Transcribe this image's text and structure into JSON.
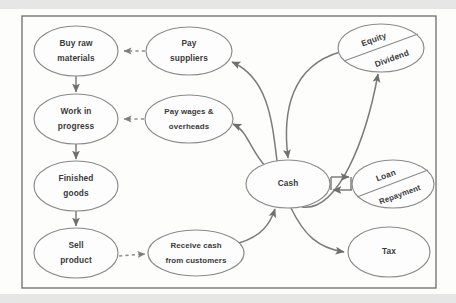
{
  "diagram": {
    "type": "flow-diagram",
    "frame": {
      "x": 22,
      "y": 16,
      "width": 414,
      "height": 272
    },
    "palette": {
      "page_background": "#fdfdfc",
      "node_fill": "#fdfdfd",
      "node_stroke": "#8a8a8a",
      "edge_stroke": "#7c7c7c",
      "frame_stroke": "#6d6d6d",
      "text": "#3a3a3a"
    },
    "nodes": [
      {
        "id": "buy-raw-materials",
        "lines": [
          "Buy raw",
          "materials"
        ],
        "cx": 76,
        "cy": 51,
        "rx": 42,
        "ry": 25,
        "split": false
      },
      {
        "id": "work-in-progress",
        "lines": [
          "Work in",
          "progress"
        ],
        "cx": 76,
        "cy": 119,
        "rx": 42,
        "ry": 25,
        "split": false
      },
      {
        "id": "finished-goods",
        "lines": [
          "Finished",
          "goods"
        ],
        "cx": 76,
        "cy": 186,
        "rx": 42,
        "ry": 25,
        "split": false
      },
      {
        "id": "sell-product",
        "lines": [
          "Sell",
          "product"
        ],
        "cx": 76,
        "cy": 253,
        "rx": 42,
        "ry": 25,
        "split": false
      },
      {
        "id": "pay-suppliers",
        "lines": [
          "Pay",
          "suppliers"
        ],
        "cx": 189,
        "cy": 51,
        "rx": 43,
        "ry": 24,
        "split": false
      },
      {
        "id": "pay-wages-overheads",
        "lines": [
          "Pay wages &",
          "overheads"
        ],
        "cx": 189,
        "cy": 119,
        "rx": 44,
        "ry": 24,
        "split": false
      },
      {
        "id": "receive-cash-from-customers",
        "lines": [
          "Receive cash",
          "from customers"
        ],
        "cx": 196,
        "cy": 253,
        "rx": 48,
        "ry": 23,
        "split": false
      },
      {
        "id": "cash",
        "lines": [
          "Cash"
        ],
        "cx": 288,
        "cy": 184,
        "rx": 42,
        "ry": 24,
        "split": false
      },
      {
        "id": "equity-dividend",
        "lines": [
          "Equity",
          "Dividend"
        ],
        "cx": 381,
        "cy": 48,
        "rx": 43,
        "ry": 24,
        "split": true,
        "split_label_top": "Equity",
        "split_label_bottom": "Dividend"
      },
      {
        "id": "loan-repayment",
        "lines": [
          "Loan",
          "Repayment"
        ],
        "cx": 393,
        "cy": 184,
        "rx": 41,
        "ry": 24,
        "split": true,
        "split_label_top": "Loan",
        "split_label_bottom": "Repayment"
      },
      {
        "id": "tax",
        "lines": [
          "Tax"
        ],
        "cx": 389,
        "cy": 252,
        "rx": 41,
        "ry": 25,
        "split": false
      }
    ],
    "edges": [
      {
        "id": "buy-to-wip",
        "from": "buy-raw-materials",
        "to": "work-in-progress",
        "style": "solid",
        "label": ""
      },
      {
        "id": "wip-to-finished",
        "from": "work-in-progress",
        "to": "finished-goods",
        "style": "solid",
        "label": ""
      },
      {
        "id": "finished-to-sell",
        "from": "finished-goods",
        "to": "sell-product",
        "style": "solid",
        "label": ""
      },
      {
        "id": "pay-suppliers-to-buy",
        "from": "pay-suppliers",
        "to": "buy-raw-materials",
        "style": "dashed",
        "label": ""
      },
      {
        "id": "pay-wages-to-wip",
        "from": "pay-wages-overheads",
        "to": "work-in-progress",
        "style": "dashed",
        "label": ""
      },
      {
        "id": "sell-to-receive-cash",
        "from": "sell-product",
        "to": "receive-cash-from-customers",
        "style": "dashed",
        "label": ""
      },
      {
        "id": "cash-to-pay-suppliers",
        "from": "cash",
        "to": "pay-suppliers",
        "style": "solid",
        "label": ""
      },
      {
        "id": "cash-to-pay-wages",
        "from": "cash",
        "to": "pay-wages-overheads",
        "style": "solid",
        "label": ""
      },
      {
        "id": "equity-to-cash",
        "from": "equity-dividend",
        "to": "cash",
        "style": "solid",
        "label": ""
      },
      {
        "id": "cash-to-dividend",
        "from": "cash",
        "to": "equity-dividend",
        "style": "solid",
        "label": ""
      },
      {
        "id": "cash-to-loan",
        "from": "cash",
        "to": "loan-repayment",
        "style": "solid",
        "label": ""
      },
      {
        "id": "loan-to-cash",
        "from": "loan-repayment",
        "to": "cash",
        "style": "solid",
        "label": ""
      },
      {
        "id": "cash-to-tax",
        "from": "cash",
        "to": "tax",
        "style": "solid",
        "label": ""
      },
      {
        "id": "receive-cash-to-cash",
        "from": "receive-cash-from-customers",
        "to": "cash",
        "style": "solid",
        "label": ""
      }
    ]
  }
}
